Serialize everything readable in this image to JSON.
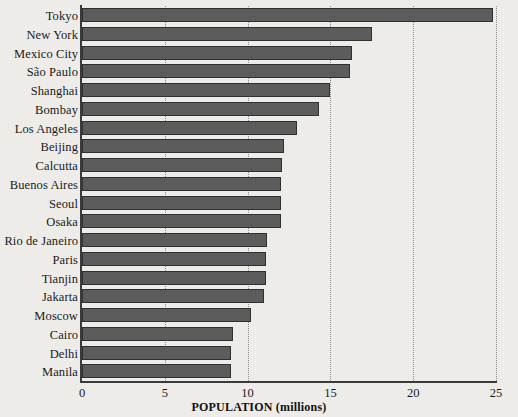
{
  "chart_data": {
    "type": "bar",
    "orientation": "horizontal",
    "title": "",
    "xlabel": "POPULATION (millions)",
    "ylabel": "",
    "xlim": [
      0,
      25
    ],
    "xticks": [
      0,
      5,
      10,
      15,
      20,
      25
    ],
    "xtick_labels": [
      "0",
      "5",
      "10",
      "15",
      "20",
      "25"
    ],
    "grid": "vertical-dotted",
    "legend": "none",
    "bar_color": "#5c5c5c",
    "bar_edge_color": "#303030",
    "background_color": "#edece8",
    "categories": [
      "Tokyo",
      "New York",
      "Mexico City",
      "São Paulo",
      "Shanghai",
      "Bombay",
      "Los Angeles",
      "Beijing",
      "Calcutta",
      "Buenos Aires",
      "Seoul",
      "Osaka",
      "Rio de Janeiro",
      "Paris",
      "Tianjin",
      "Jakarta",
      "Moscow",
      "Cairo",
      "Delhi",
      "Manila"
    ],
    "values": [
      24.8,
      17.5,
      16.3,
      16.2,
      15.0,
      14.3,
      13.0,
      12.2,
      12.1,
      12.0,
      12.0,
      12.0,
      11.2,
      11.1,
      11.1,
      11.0,
      10.2,
      9.1,
      9.0,
      9.0
    ]
  }
}
